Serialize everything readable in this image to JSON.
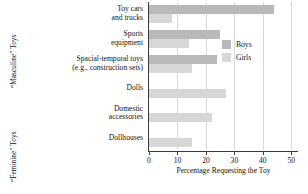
{
  "chart_data": {
    "type": "bar",
    "orientation": "horizontal",
    "title": "",
    "xlabel": "Percentage Requesting the Toy",
    "ylabel": "",
    "xlim": [
      0,
      52
    ],
    "xticks": [
      0,
      10,
      20,
      30,
      40,
      50
    ],
    "xtick_labels": [
      "0",
      "10",
      "20",
      "30",
      "40",
      "50"
    ],
    "grid": true,
    "legend_position": "upper right",
    "categories": [
      "Toy cars and trucks",
      "Sports equipment",
      "Spacial-temporal toys (e.g., construction sets)",
      "Dolls",
      "Domestic accessories",
      "Dollhouses"
    ],
    "series": [
      {
        "name": "Boys",
        "color": "#b9b9b9",
        "values": [
          44,
          25,
          24,
          0,
          0,
          0
        ]
      },
      {
        "name": "Girls",
        "color": "#d7d7d7",
        "values": [
          8,
          14,
          15,
          27,
          22,
          15
        ]
      }
    ]
  },
  "axis": {
    "x_title": "Percentage Requesting the Toy",
    "ticks": [
      "0",
      "10",
      "20",
      "30",
      "40",
      "50"
    ]
  },
  "group_labels": {
    "masculine": "“Masculine” Toys",
    "feminine": "“Feminine” Toys"
  },
  "categories": [
    {
      "line1": "Toy cars",
      "line2": "and trucks"
    },
    {
      "line1": "Sports",
      "line2": "equipment"
    },
    {
      "line1": "Spacial-temporal toys",
      "line2": "(e.g., construction sets)"
    },
    {
      "line1": "Dolls",
      "line2": ""
    },
    {
      "line1": "Domestic",
      "line2": "accessories"
    },
    {
      "line1": "Dollhouses",
      "line2": ""
    }
  ],
  "legend": {
    "items": [
      {
        "label": "Boys",
        "swatch": "boys-swatch"
      },
      {
        "label": "Girls",
        "swatch": "girls-swatch"
      }
    ]
  }
}
